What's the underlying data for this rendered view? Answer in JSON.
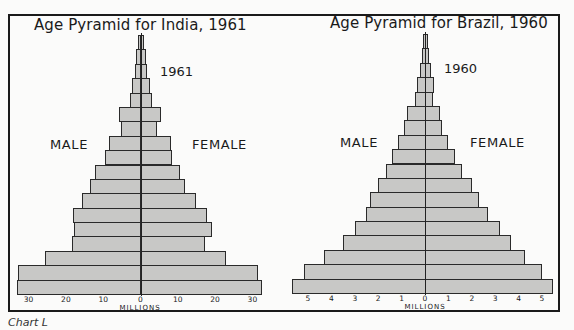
{
  "caption": "Chart L",
  "chart_data": [
    {
      "type": "bar",
      "subtype": "population-pyramid",
      "title": "Age Pyramid for India, 1961",
      "year_label": "1961",
      "left_label": "MALE",
      "right_label": "FEMALE",
      "xlabel": "MILLIONS",
      "x_ticks": [
        "30",
        "20",
        "10",
        "0",
        "10",
        "20",
        "30"
      ],
      "xlim": [
        -35,
        35
      ],
      "age_groups_order": "top-to-bottom (oldest to youngest)",
      "series": [
        {
          "name": "Male",
          "values": [
            0.8,
            1.2,
            1.5,
            2.3,
            2.8,
            5.8,
            5.2,
            8.4,
            9.5,
            12.2,
            13.5,
            15.7,
            18.1,
            17.8,
            18.4,
            25.6,
            32.8,
            33.1
          ]
        },
        {
          "name": "Female",
          "values": [
            0.8,
            1.2,
            1.5,
            2.3,
            2.8,
            5.2,
            4.1,
            7.9,
            8.2,
            10.3,
            11.7,
            14.6,
            17.6,
            18.9,
            17.0,
            22.7,
            31.2,
            32.3
          ]
        }
      ],
      "grid": false
    },
    {
      "type": "bar",
      "subtype": "population-pyramid",
      "title": "Age Pyramid for Brazil, 1960",
      "year_label": "1960",
      "left_label": "MALE",
      "right_label": "FEMALE",
      "xlabel": "MILLIONS",
      "x_ticks": [
        "5",
        "4",
        "3",
        "2",
        "1",
        "0",
        "1",
        "2",
        "3",
        "4",
        "5"
      ],
      "xlim": [
        -5.7,
        5.7
      ],
      "age_groups_order": "top-to-bottom (oldest to youngest)",
      "series": [
        {
          "name": "Male",
          "values": [
            0.09,
            0.13,
            0.21,
            0.34,
            0.43,
            0.77,
            0.9,
            1.15,
            1.41,
            1.67,
            2.01,
            2.35,
            2.52,
            2.99,
            3.5,
            4.32,
            5.17,
            5.68
          ]
        },
        {
          "name": "Female",
          "values": [
            0.09,
            0.13,
            0.21,
            0.34,
            0.3,
            0.6,
            0.68,
            0.94,
            1.24,
            1.54,
            1.97,
            2.27,
            2.65,
            3.16,
            3.63,
            4.23,
            4.96,
            5.43
          ]
        }
      ],
      "grid": false
    }
  ],
  "layout": {
    "colors": {
      "bar_fill": "#c8c8c6",
      "bar_stroke": "#2a2a2a",
      "frame": "#1a1a1a"
    }
  }
}
